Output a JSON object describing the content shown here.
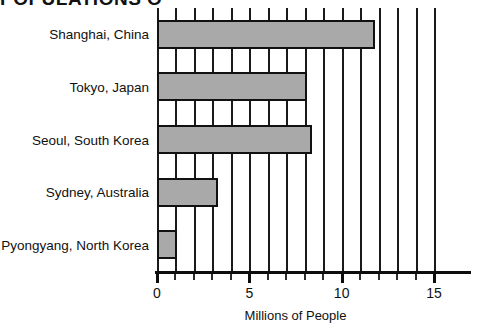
{
  "title": "POPULATIONS O",
  "chart_data": {
    "type": "bar",
    "orientation": "horizontal",
    "title": "POPULATIONS O",
    "xlabel": "Millions of People",
    "ylabel": "",
    "categories": [
      "Shanghai, China",
      "Tokyo, Japan",
      "Seoul, South Korea",
      "Sydney, Australia",
      "Pyongyang, North Korea"
    ],
    "values": [
      11.8,
      8.1,
      8.4,
      3.3,
      1.1
    ],
    "xlim": [
      0,
      15
    ],
    "xticks": [
      0,
      5,
      10,
      15
    ],
    "xtick_labels": [
      "0",
      "5",
      "10",
      "15"
    ],
    "minor_tick_interval": 1,
    "grid": "vertical",
    "legend": "none",
    "bar_fill_color": "#a9a9a9",
    "bar_edge_color": "#111111",
    "axis_color": "#0d0d0d",
    "background_color": "#ffffff"
  },
  "axis": {
    "x_title": "Millions of People",
    "ticks": [
      {
        "label": "0",
        "value": 0
      },
      {
        "label": "5",
        "value": 5
      },
      {
        "label": "10",
        "value": 10
      },
      {
        "label": "15",
        "value": 15
      }
    ]
  }
}
